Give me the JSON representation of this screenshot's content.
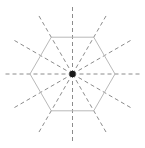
{
  "figure": {
    "width": 145,
    "height": 148,
    "background_color": "#ffffff"
  },
  "diagram": {
    "type": "radial-symmetry-diagram",
    "center": {
      "x": 72.5,
      "y": 74.0
    },
    "center_dot": {
      "label": "center-point",
      "radius": 3.2,
      "color": "#1a1a1a"
    },
    "polygon": {
      "label": "hexagon",
      "sides": 6,
      "circumradius": 42.5,
      "orientation_degrees": 0,
      "stroke_color": "#b9b9b9",
      "stroke_width": 1.0,
      "fill": "none",
      "vertices": [
        {
          "x": 115.0,
          "y": 74.0
        },
        {
          "x": 93.75,
          "y": 37.19
        },
        {
          "x": 51.25,
          "y": 37.19
        },
        {
          "x": 30.0,
          "y": 74.0
        },
        {
          "x": 51.25,
          "y": 110.81
        },
        {
          "x": 93.75,
          "y": 110.81
        }
      ]
    },
    "rays": {
      "label": "dashed-radial-rays",
      "count": 12,
      "angle_step_degrees": 30,
      "length": 70,
      "stroke_color": "#8c8c8c",
      "stroke_width": 1.0,
      "dash_pattern": "4 3",
      "angles_degrees": [
        0,
        30,
        60,
        90,
        120,
        150,
        180,
        210,
        240,
        270,
        300,
        330
      ]
    }
  }
}
